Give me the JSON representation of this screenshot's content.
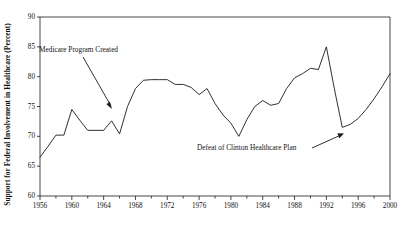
{
  "chart_data": {
    "type": "line",
    "title": "",
    "xlabel": "",
    "ylabel": "Support for Federal Involvement in Healthcare (Percent)",
    "xlim": [
      1956,
      2000
    ],
    "ylim": [
      60,
      90
    ],
    "grid": false,
    "legend": "none",
    "x_ticks_major": [
      1956,
      1960,
      1964,
      1968,
      1972,
      1976,
      1980,
      1984,
      1988,
      1992,
      1996,
      2000
    ],
    "x_tick_labels": [
      "1956",
      "1960",
      "1964",
      "1968",
      "1972",
      "1976",
      "1980",
      "1984",
      "1988",
      "1992",
      "1996",
      "2000"
    ],
    "x_tick_minor_step": 2,
    "y_ticks": [
      60,
      65,
      70,
      75,
      80,
      85,
      90
    ],
    "y_tick_labels": [
      "60",
      "65",
      "70",
      "75",
      "80",
      "85",
      "90"
    ],
    "series": [
      {
        "name": "Support for Federal Involvement in Healthcare",
        "color": "#1a1a1a",
        "x": [
          1956,
          1957,
          1958,
          1959,
          1960,
          1961,
          1962,
          1964,
          1965,
          1966,
          1967,
          1968,
          1969,
          1970,
          1971,
          1972,
          1973,
          1974,
          1975,
          1976,
          1977,
          1978,
          1979,
          1980,
          1981,
          1982,
          1983,
          1984,
          1985,
          1986,
          1987,
          1988,
          1989,
          1990,
          1991,
          1992,
          1993,
          1994,
          1995,
          1996,
          1997,
          1998,
          1999,
          2000
        ],
        "y": [
          66.5,
          68.3,
          70.2,
          70.2,
          74.5,
          72.7,
          71.0,
          71.0,
          72.6,
          70.4,
          75.0,
          78.0,
          79.4,
          79.5,
          79.5,
          79.5,
          78.7,
          78.7,
          78.2,
          77.0,
          78.0,
          75.5,
          73.6,
          72.2,
          70.0,
          72.8,
          75.0,
          76.0,
          75.2,
          75.5,
          78.0,
          79.8,
          80.5,
          81.4,
          81.2,
          85.0,
          78.0,
          71.5,
          72.0,
          73.0,
          74.5,
          76.3,
          78.3,
          80.5
        ]
      }
    ],
    "annotations": [
      {
        "name": "medicare",
        "text": "Medicare Program Created",
        "points_to_year": 1965,
        "points_to_value": 72.6
      },
      {
        "name": "clinton",
        "text": "Defeat of Clinton Healthcare Plan",
        "points_to_year": 1994,
        "points_to_value": 71.5
      }
    ]
  }
}
